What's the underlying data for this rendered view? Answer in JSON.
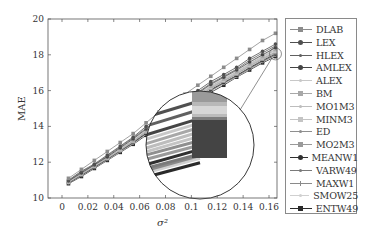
{
  "chart_data": {
    "type": "line",
    "title": "",
    "xlabel": "σ²",
    "ylabel": "MAE",
    "xlim": [
      -0.008,
      0.172
    ],
    "ylim": [
      10,
      20
    ],
    "x_ticks": [
      "0",
      "0.02",
      "0.04",
      "0.06",
      "0.08",
      "0.1",
      "0.12",
      "0.14",
      "0.16"
    ],
    "x_tick_values": [
      0,
      0.02,
      0.04,
      0.06,
      0.08,
      0.1,
      0.12,
      0.14,
      0.16
    ],
    "y_ticks": [
      "10",
      "12",
      "14",
      "16",
      "18",
      "20"
    ],
    "y_tick_values": [
      10,
      12,
      14,
      16,
      18,
      20
    ],
    "grid": false,
    "legend_position": "outside right",
    "x": [
      0.005,
      0.015,
      0.025,
      0.035,
      0.045,
      0.055,
      0.065,
      0.075,
      0.085,
      0.095,
      0.105,
      0.115,
      0.125,
      0.135,
      0.145,
      0.155,
      0.165
    ],
    "series": [
      {
        "name": "DLAB",
        "color": "#8c8c8c",
        "marker": "square",
        "values": [
          11.1,
          11.6,
          12.1,
          12.6,
          13.1,
          13.6,
          14.2,
          14.8,
          15.3,
          15.8,
          16.3,
          16.8,
          17.3,
          17.8,
          18.3,
          18.8,
          19.2
        ]
      },
      {
        "name": "LEX",
        "color": "#505050",
        "marker": "circle",
        "values": [
          11.0,
          11.5,
          11.9,
          12.4,
          12.9,
          13.4,
          14.0,
          14.5,
          15.0,
          15.5,
          16.0,
          16.5,
          16.9,
          17.3,
          17.8,
          18.2,
          18.6
        ]
      },
      {
        "name": "HLEX",
        "color": "#606060",
        "marker": "dot",
        "values": [
          10.95,
          11.45,
          11.85,
          12.35,
          12.85,
          13.35,
          13.9,
          14.4,
          14.9,
          15.4,
          15.9,
          16.4,
          16.8,
          17.2,
          17.7,
          18.1,
          18.5
        ]
      },
      {
        "name": "AMLEX",
        "color": "#454545",
        "marker": "circle",
        "values": [
          10.95,
          11.4,
          11.85,
          12.3,
          12.8,
          13.3,
          13.85,
          14.35,
          14.85,
          15.35,
          15.85,
          16.35,
          16.75,
          17.15,
          17.6,
          18.0,
          18.4
        ]
      },
      {
        "name": "ALEX",
        "color": "#c8c8c8",
        "marker": "dot",
        "values": [
          10.9,
          11.4,
          11.8,
          12.3,
          12.75,
          13.25,
          13.8,
          14.3,
          14.8,
          15.3,
          15.8,
          16.3,
          16.7,
          17.1,
          17.55,
          17.95,
          18.35
        ]
      },
      {
        "name": "BM",
        "color": "#a8a8a8",
        "marker": "square",
        "values": [
          10.9,
          11.35,
          11.8,
          12.25,
          12.75,
          13.2,
          13.75,
          14.25,
          14.75,
          15.25,
          15.75,
          16.25,
          16.65,
          17.05,
          17.5,
          17.9,
          18.3
        ]
      },
      {
        "name": "MO1M3",
        "color": "#bdbdbd",
        "marker": "dot",
        "values": [
          10.9,
          11.35,
          11.8,
          12.25,
          12.7,
          13.2,
          13.75,
          14.25,
          14.75,
          15.2,
          15.7,
          16.2,
          16.6,
          17.0,
          17.45,
          17.85,
          18.25
        ]
      },
      {
        "name": "MINM3",
        "color": "#c4c4c4",
        "marker": "square",
        "values": [
          10.88,
          11.33,
          11.78,
          12.23,
          12.7,
          13.18,
          13.72,
          14.22,
          14.72,
          15.18,
          15.68,
          16.18,
          16.58,
          16.98,
          17.42,
          17.82,
          18.2
        ]
      },
      {
        "name": "ED",
        "color": "#8f8f8f",
        "marker": "dot",
        "values": [
          10.88,
          11.32,
          11.76,
          12.22,
          12.68,
          13.16,
          13.7,
          14.2,
          14.7,
          15.16,
          15.66,
          16.16,
          16.56,
          16.96,
          17.4,
          17.8,
          18.15
        ]
      },
      {
        "name": "MO2M3",
        "color": "#9a9a9a",
        "marker": "square",
        "values": [
          10.87,
          11.3,
          11.75,
          12.2,
          12.66,
          13.14,
          13.68,
          14.18,
          14.68,
          15.14,
          15.64,
          16.12,
          16.52,
          16.92,
          17.35,
          17.75,
          18.1
        ]
      },
      {
        "name": "MEANW1",
        "color": "#303030",
        "marker": "circle",
        "values": [
          10.85,
          11.28,
          11.72,
          12.18,
          12.64,
          13.1,
          13.62,
          14.12,
          14.62,
          15.08,
          15.56,
          16.05,
          16.45,
          16.85,
          17.28,
          17.68,
          18.05
        ]
      },
      {
        "name": "VARW49",
        "color": "#7a7a7a",
        "marker": "dot",
        "values": [
          10.85,
          11.27,
          11.7,
          12.16,
          12.62,
          13.08,
          13.6,
          14.1,
          14.6,
          15.05,
          15.53,
          16.02,
          16.42,
          16.82,
          17.25,
          17.65,
          18.0
        ]
      },
      {
        "name": "MAXW1",
        "color": "#8a8a8a",
        "marker": "plus",
        "values": [
          10.84,
          11.26,
          11.7,
          12.15,
          12.6,
          13.06,
          13.58,
          14.08,
          14.58,
          15.03,
          15.5,
          16.0,
          16.4,
          16.8,
          17.22,
          17.62,
          17.98
        ]
      },
      {
        "name": "SMOW25",
        "color": "#d0d0d0",
        "marker": "dot",
        "values": [
          10.83,
          11.25,
          11.68,
          12.13,
          12.58,
          13.04,
          13.56,
          14.06,
          14.56,
          15.0,
          15.48,
          15.97,
          16.37,
          16.77,
          17.2,
          17.6,
          17.95
        ]
      },
      {
        "name": "ENTW49",
        "color": "#2a2a2a",
        "marker": "square",
        "values": [
          10.8,
          11.2,
          11.65,
          12.1,
          12.55,
          13.0,
          13.5,
          14.0,
          14.5,
          14.95,
          15.4,
          15.9,
          16.3,
          16.75,
          17.15,
          17.55,
          17.9
        ]
      }
    ],
    "annotations": [
      {
        "type": "zoom-circle-inset",
        "target": [
          0.165,
          18.1
        ],
        "note": "magnified view of line endpoints near σ²=0.165"
      }
    ]
  }
}
